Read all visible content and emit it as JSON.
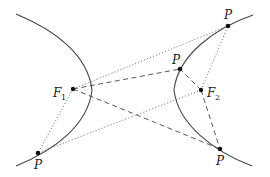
{
  "diagram": {
    "foci": [
      {
        "id": "F1",
        "label": "F",
        "subscript": "1",
        "x": 73,
        "y": 89
      },
      {
        "id": "F2",
        "label": "F",
        "subscript": "2",
        "x": 201,
        "y": 90
      }
    ],
    "points": [
      {
        "id": "P_top_right",
        "label": "P",
        "x": 228,
        "y": 26,
        "line_style": "dotted"
      },
      {
        "id": "P_middle",
        "label": "P",
        "x": 180,
        "y": 69,
        "line_style": "dashed"
      },
      {
        "id": "P_bottom_left",
        "label": "P",
        "x": 38,
        "y": 153,
        "line_style": "dotted"
      },
      {
        "id": "P_bottom_right",
        "label": "P",
        "x": 220,
        "y": 149,
        "line_style": "dashed"
      }
    ],
    "branches": [
      "left",
      "right"
    ],
    "colors": {
      "curve": "#444444",
      "lines": "#555555",
      "points": "#111111"
    }
  }
}
